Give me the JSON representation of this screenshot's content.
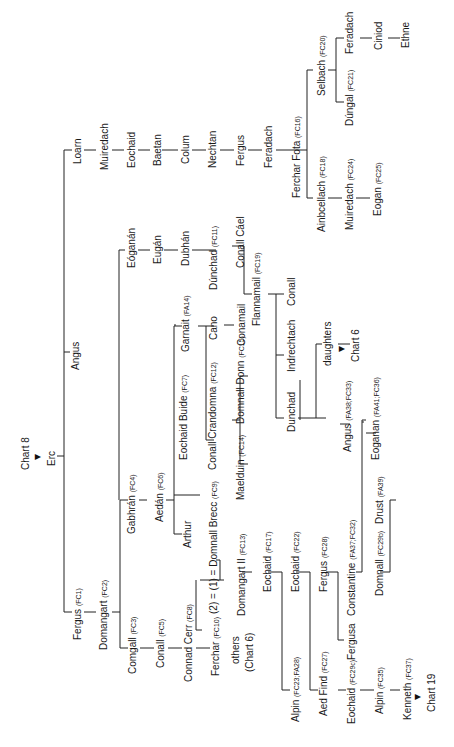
{
  "chart": {
    "orientation": "rotated-90-ccw",
    "root_ref": "Chart 8",
    "root": "Erc",
    "people": {
      "erc": {
        "name": "Erc"
      },
      "loarn": {
        "name": "Loarn"
      },
      "angus": {
        "name": "Angus"
      },
      "fergus_fc1": {
        "name": "Fergus",
        "code": "(FC1)"
      },
      "muiredach": {
        "name": "Muiredach"
      },
      "eochaid_l": {
        "name": "Eochaid"
      },
      "baetan": {
        "name": "Baetan"
      },
      "colum": {
        "name": "Colum"
      },
      "nechtan": {
        "name": "Nechtan"
      },
      "fergus_l": {
        "name": "Fergus"
      },
      "feradach_l": {
        "name": "Feradach"
      },
      "ferchar_fota": {
        "name": "Ferchar Fota",
        "code": "(FC16)"
      },
      "selbach": {
        "name": "Selbach",
        "code": "(FC20)"
      },
      "feradach_s": {
        "name": "Feradach"
      },
      "ciniod": {
        "name": "Ciniod"
      },
      "ethne": {
        "name": "Ethne"
      },
      "dungal": {
        "name": "Dúngal",
        "code": "(FC21)"
      },
      "ainbcellach": {
        "name": "Ainbcellach",
        "code": "(FC18)"
      },
      "muiredach_fc24": {
        "name": "Muiredach",
        "code": "(FC24)"
      },
      "eogan_fc25": {
        "name": "Eogan",
        "code": "(FC25)"
      },
      "eoganan": {
        "name": "Eóganán"
      },
      "eugan": {
        "name": "Eugán"
      },
      "dubhan": {
        "name": "Dubhán"
      },
      "dunchad_fc11": {
        "name": "Dúnchad",
        "code": "(FC11)"
      },
      "conall_cael": {
        "name": "Conall Cáel"
      },
      "flannamail": {
        "name": "Flannamail",
        "code": "(FC19)"
      },
      "conall_f": {
        "name": "Conall"
      },
      "indrechtach": {
        "name": "Indrechtach"
      },
      "dunchad": {
        "name": "Dunchad"
      },
      "daughters": {
        "name": "daughters"
      },
      "chart6_a": {
        "name": "Chart 6"
      },
      "angus_fa38": {
        "name": "Angus",
        "code": "(FA38;FC33)"
      },
      "eoganan_fa41": {
        "name": "Eoganan",
        "code": "(FA41;FC36)"
      },
      "garnait": {
        "name": "Garnait",
        "code": "(FA14)"
      },
      "cano": {
        "name": "Cano"
      },
      "conamail": {
        "name": "Conamail"
      },
      "eochaid_buide": {
        "name": "Eochaid Buide",
        "code": "(FC7)"
      },
      "conall_crandomna": {
        "name": "Conall Crandomna",
        "code": "(FC12)"
      },
      "domnall_donn": {
        "name": "Domnall Donn",
        "code": "(FC15)"
      },
      "maelduin": {
        "name": "Maelduin",
        "code": "(FC14)"
      },
      "domnall_brecc": {
        "name": "(2) = (1) = Domnall Brecc",
        "code": "(FC9)"
      },
      "domangart_ii": {
        "name": "Domangart II",
        "code": "(FC13)"
      },
      "others": {
        "name": "others"
      },
      "others_ref": {
        "name": "(Chart 6)"
      },
      "gabhran": {
        "name": "Gabhrán",
        "code": "(FC4)"
      },
      "aedan": {
        "name": "Aedán",
        "code": "(FC6)"
      },
      "arthur": {
        "name": "Arthur"
      },
      "domangart": {
        "name": "Domangart",
        "code": "(FC2)"
      },
      "comgall": {
        "name": "Comgall",
        "code": "(FC3)"
      },
      "conall_fc5": {
        "name": "Conall",
        "code": "(FC5)"
      },
      "connad_cerr": {
        "name": "Connad Cerr",
        "code": "(FC8)"
      },
      "ferchar_fc10": {
        "name": "Ferchar",
        "code": "(FC10)"
      },
      "eochaid_fc17": {
        "name": "Eochaid",
        "code": "(FC17)"
      },
      "alpin_fc23": {
        "name": "Alpin",
        "code": "(FC23;FA28)"
      },
      "eochaid_fc22": {
        "name": "Eochaid",
        "code": "(FC22)"
      },
      "aed_find": {
        "name": "Aed Find",
        "code": "(FC27)"
      },
      "fergus_fc28": {
        "name": "Fergus",
        "code": "(FC28)"
      },
      "fergusa": {
        "name": "Fergusa"
      },
      "constantine": {
        "name": "Constantine",
        "code": "(FA37;FC32)"
      },
      "domnall_fc29b": {
        "name": "Domnall",
        "code": "(FC29b)"
      },
      "drust": {
        "name": "Drust",
        "code": "(FA39)"
      },
      "eochaid_fc29c": {
        "name": "Eochaid",
        "code": "(FC29c)"
      },
      "alpin_fc35": {
        "name": "Alpin",
        "code": "(FC35)"
      },
      "kenneth": {
        "name": "Kenneth",
        "code": "(FC37)"
      },
      "chart19": {
        "name": "Chart 19"
      }
    }
  }
}
